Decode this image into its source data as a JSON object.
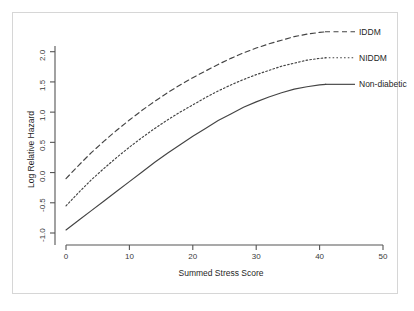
{
  "chart_data": {
    "type": "line",
    "title": "",
    "xlabel": "Summed Stress Score",
    "ylabel": "Log Relative Hazard",
    "xlim": [
      0,
      50
    ],
    "ylim": [
      -1.0,
      2.3
    ],
    "xticks": [
      "0",
      "10",
      "20",
      "30",
      "40",
      "50"
    ],
    "xtick_values": [
      0,
      10,
      20,
      30,
      40,
      50
    ],
    "yticks": [
      "-1.0",
      "-0.5",
      "0.0",
      "0.5",
      "1.0",
      "1.5",
      "2.0"
    ],
    "ytick_values": [
      -1.0,
      -0.5,
      0.0,
      0.5,
      1.0,
      1.5,
      2.0
    ],
    "grid": false,
    "legend_position": "right-inline",
    "x": [
      0,
      2,
      4,
      6,
      8,
      10,
      12,
      14,
      16,
      18,
      20,
      22,
      24,
      26,
      28,
      30,
      32,
      34,
      36,
      38,
      40,
      41
    ],
    "series": [
      {
        "name": "IDDM",
        "style": "dashed",
        "color": "#444444",
        "values": [
          -0.1,
          0.12,
          0.33,
          0.52,
          0.7,
          0.87,
          1.03,
          1.18,
          1.32,
          1.45,
          1.57,
          1.68,
          1.79,
          1.89,
          1.98,
          2.06,
          2.13,
          2.19,
          2.25,
          2.29,
          2.32,
          2.33
        ]
      },
      {
        "name": "NIDDM",
        "style": "dotted",
        "color": "#444444",
        "values": [
          -0.55,
          -0.33,
          -0.12,
          0.07,
          0.25,
          0.42,
          0.58,
          0.73,
          0.87,
          1.0,
          1.12,
          1.24,
          1.35,
          1.45,
          1.54,
          1.62,
          1.69,
          1.76,
          1.81,
          1.86,
          1.89,
          1.9
        ]
      },
      {
        "name": "Non-diabetic",
        "style": "solid",
        "color": "#444444",
        "values": [
          -0.95,
          -0.79,
          -0.63,
          -0.47,
          -0.31,
          -0.15,
          0.01,
          0.17,
          0.32,
          0.46,
          0.6,
          0.73,
          0.86,
          0.97,
          1.08,
          1.17,
          1.25,
          1.32,
          1.38,
          1.42,
          1.45,
          1.46
        ]
      }
    ],
    "legend_entries": [
      {
        "label": "IDDM",
        "style": "dashed"
      },
      {
        "label": "NIDDM",
        "style": "dotted"
      },
      {
        "label": "Non-diabetic",
        "style": "solid"
      }
    ]
  },
  "colors": {
    "axis": "#555555",
    "frame": "#d6d6d6",
    "text": "#1f1f1f",
    "curve": "#444444",
    "background": "#ffffff"
  }
}
